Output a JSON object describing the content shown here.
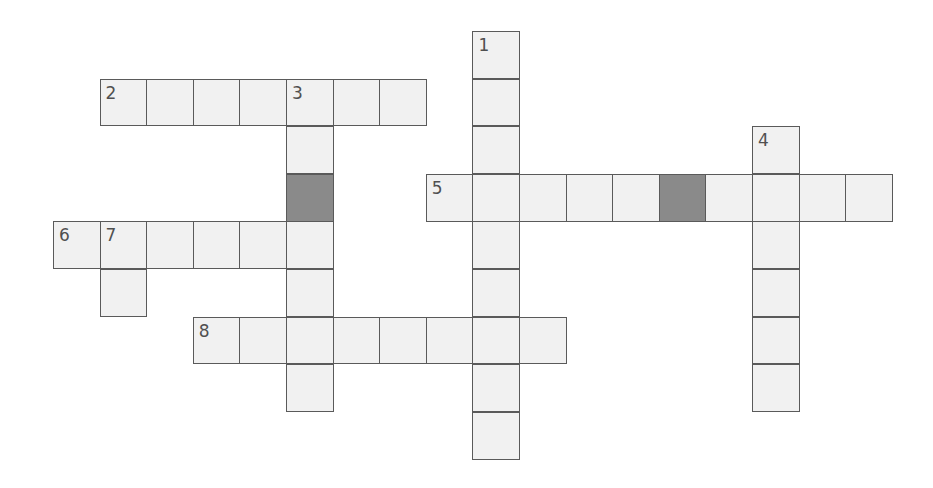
{
  "puzzle": {
    "origin_x": 53,
    "origin_y": 31,
    "cell_w": 46.6,
    "cell_h": 47.6,
    "colors": {
      "cell_fill": "#f1f1f1",
      "block_fill": "#8a8a8a",
      "border": "#5a5a5a",
      "number": "#505050"
    },
    "words": [
      {
        "number": "1",
        "direction": "down",
        "row": 0,
        "col": 9,
        "length": 9
      },
      {
        "number": "2",
        "direction": "across",
        "row": 1,
        "col": 1,
        "length": 7
      },
      {
        "number": "3",
        "direction": "down",
        "row": 1,
        "col": 5,
        "length": 7
      },
      {
        "number": "4",
        "direction": "down",
        "row": 2,
        "col": 15,
        "length": 6
      },
      {
        "number": "5",
        "direction": "across",
        "row": 3,
        "col": 8,
        "length": 10
      },
      {
        "number": "6",
        "direction": "across",
        "row": 4,
        "col": 0,
        "length": 6
      },
      {
        "number": "7",
        "direction": "down",
        "row": 4,
        "col": 1,
        "length": 2
      },
      {
        "number": "8",
        "direction": "across",
        "row": 6,
        "col": 3,
        "length": 8
      }
    ],
    "blocks": [
      {
        "row": 3,
        "col": 5
      },
      {
        "row": 3,
        "col": 13
      }
    ]
  }
}
